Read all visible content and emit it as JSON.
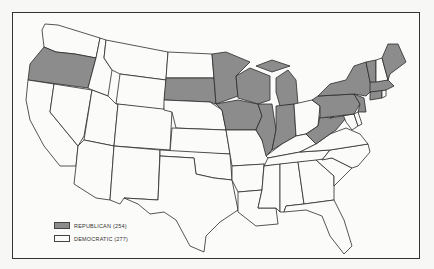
{
  "colors": {
    "republican": "#8c8c8c",
    "democratic": "#fbfbfa",
    "outline": "#2b2b2b"
  },
  "legend": [
    {
      "party": "republican",
      "label": "REPUBLICAN (254)"
    },
    {
      "party": "democratic",
      "label": "DEMOCRATIC (277)"
    }
  ],
  "states": {
    "republican": [
      "OR",
      "SD",
      "MN",
      "IA",
      "WI",
      "MI",
      "IL",
      "IN",
      "PA",
      "NY",
      "NJ",
      "CT",
      "VT",
      "ME",
      "MA",
      "WV"
    ],
    "democratic": [
      "WA",
      "CA",
      "NV",
      "ID",
      "MT",
      "WY",
      "UT",
      "AZ",
      "CO",
      "NM",
      "ND",
      "NE",
      "KS",
      "OK",
      "TX",
      "MO",
      "AR",
      "LA",
      "MS",
      "AL",
      "TN",
      "KY",
      "OH",
      "GA",
      "FL",
      "SC",
      "NC",
      "VA",
      "MD",
      "DE",
      "NH",
      "RI"
    ]
  }
}
